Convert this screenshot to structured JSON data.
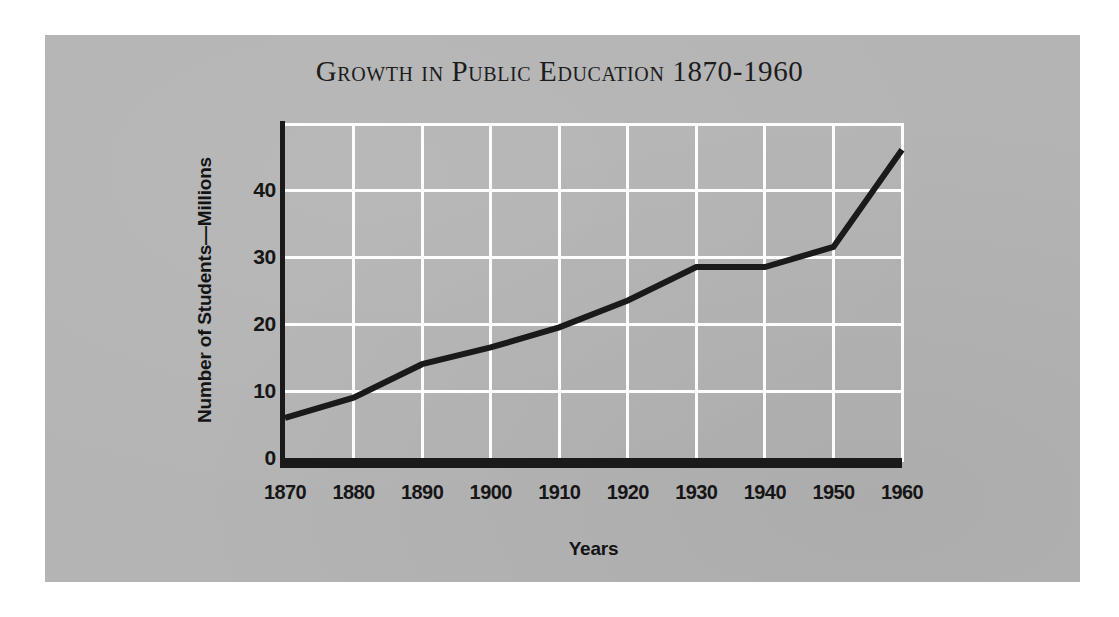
{
  "page": {
    "background_color": "#ffffff",
    "panel_color": "#b4b4b4"
  },
  "figure": {
    "title": "Growth in Public Education 1870-1960",
    "line_color": "#1a1a1a",
    "grid_color": "#fdfdfd",
    "axis_color": "#1a1a1a"
  },
  "chart_data": {
    "type": "line",
    "title": "Growth in Public Education 1870-1960",
    "xlabel": "Years",
    "ylabel": "Number of Students—Millions",
    "x": [
      1870,
      1880,
      1890,
      1900,
      1910,
      1920,
      1930,
      1940,
      1950,
      1960
    ],
    "values": [
      6,
      9,
      14,
      16.5,
      19.5,
      23.5,
      28.5,
      28.5,
      31.5,
      46
    ],
    "xtick_labels": [
      "1870",
      "1880",
      "1890",
      "1900",
      "1910",
      "1920",
      "1930",
      "1940",
      "1950",
      "1960"
    ],
    "ytick_labels": [
      "0",
      "10",
      "20",
      "30",
      "40"
    ],
    "yticks": [
      0,
      10,
      20,
      30,
      40
    ],
    "xlim": [
      1870,
      1960
    ],
    "ylim": [
      0,
      50
    ],
    "grid": true,
    "legend": "none",
    "series": [
      {
        "name": "Number of Students—Millions",
        "values": [
          6,
          9,
          14,
          16.5,
          19.5,
          23.5,
          28.5,
          28.5,
          31.5,
          46
        ]
      }
    ]
  }
}
